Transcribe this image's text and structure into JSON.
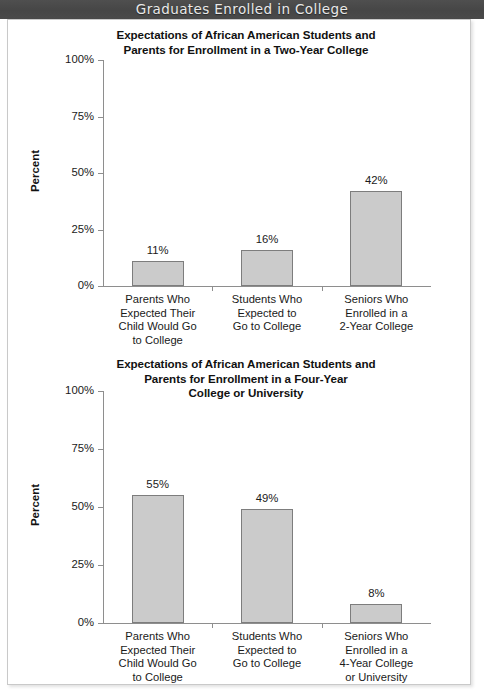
{
  "header": {
    "title": "Graduates Enrolled in College"
  },
  "chart_data": [
    {
      "type": "bar",
      "id": "two-year-college",
      "title": "Expectations of African American Students and Parents for Enrollment in a Two-Year College",
      "title_lines": [
        "Expectations of African American Students and",
        "Parents for Enrollment in a Two-Year College"
      ],
      "xlabel": "",
      "ylabel": "Percent",
      "ylim": [
        0,
        100
      ],
      "yticks": [
        0,
        25,
        50,
        75,
        100
      ],
      "ytick_labels": [
        "0%",
        "25%",
        "50%",
        "75%",
        "100%"
      ],
      "grid": false,
      "legend": "none",
      "categories": [
        "Parents Who Expected Their Child Would Go to College",
        "Students Who Expected to Go to College",
        "Seniors Who Enrolled in a 2-Year College"
      ],
      "category_lines": [
        [
          "Parents Who",
          "Expected Their",
          "Child Would Go",
          "to College"
        ],
        [
          "Students Who",
          "Expected to",
          "Go to College"
        ],
        [
          "Seniors Who",
          "Enrolled in a",
          "2-Year College"
        ]
      ],
      "values": [
        11,
        16,
        42
      ],
      "value_labels": [
        "11%",
        "16%",
        "42%"
      ],
      "bar_color": "#cbcbcb",
      "bar_border_color": "#7d7d7d"
    },
    {
      "type": "bar",
      "id": "four-year-college",
      "title": "Expectations of African American Students and Parents for Enrollment in a Four-Year College or University",
      "title_lines": [
        "Expectations of African American Students and",
        "Parents for Enrollment in a Four-Year",
        "College or University"
      ],
      "xlabel": "",
      "ylabel": "Percent",
      "ylim": [
        0,
        100
      ],
      "yticks": [
        0,
        25,
        50,
        75,
        100
      ],
      "ytick_labels": [
        "0%",
        "25%",
        "50%",
        "75%",
        "100%"
      ],
      "grid": false,
      "legend": "none",
      "categories": [
        "Parents Who Expected Their Child Would Go to College",
        "Students Who Expected to Go to College",
        "Seniors Who Enrolled in a 4-Year College or University"
      ],
      "category_lines": [
        [
          "Parents Who",
          "Expected Their",
          "Child Would Go",
          "to College"
        ],
        [
          "Students Who",
          "Expected to",
          "Go to College"
        ],
        [
          "Seniors Who",
          "Enrolled in a",
          "4-Year College",
          "or University"
        ]
      ],
      "values": [
        55,
        49,
        8
      ],
      "value_labels": [
        "55%",
        "49%",
        "8%"
      ],
      "bar_color": "#cbcbcb",
      "bar_border_color": "#7d7d7d"
    }
  ],
  "colors": {
    "header_band": "#4c4c4c",
    "header_text": "#e9e9e9",
    "sheet_background": "#ffffff",
    "sheet_border": "#c9c9c9",
    "axis": "#8e8e8e",
    "text": "#1a1a1a"
  }
}
